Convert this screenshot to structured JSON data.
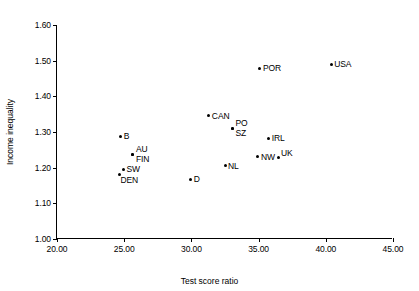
{
  "chart_data": {
    "type": "scatter",
    "title": "",
    "xlabel": "Test score ratio",
    "ylabel": "Income inequality",
    "xlim": [
      20.0,
      45.0
    ],
    "ylim": [
      1.0,
      1.6
    ],
    "xticks": [
      "20.00",
      "25.00",
      "30.00",
      "35.00",
      "40.00",
      "45.00"
    ],
    "yticks": [
      "1.60",
      "1.50",
      "1.40",
      "1.30",
      "1.20",
      "1.10",
      "1.00"
    ],
    "xtick_values": [
      20,
      25,
      30,
      35,
      40,
      45
    ],
    "ytick_values": [
      1.6,
      1.5,
      1.4,
      1.3,
      1.2,
      1.1,
      1.0
    ],
    "grid": false,
    "legend": "none",
    "marker_color": "#000000",
    "axis_color": "#000000",
    "background": "#ffffff",
    "points": [
      {
        "label": "B",
        "x": 24.75,
        "y": 1.288,
        "label_pos": "lab-r"
      },
      {
        "label": "AU",
        "x": 25.65,
        "y": 1.237,
        "label_pos": "lab-rt"
      },
      {
        "label": "FIN",
        "x": 25.65,
        "y": 1.237,
        "label_pos": "lab-rb"
      },
      {
        "label": "SW",
        "x": 24.95,
        "y": 1.195,
        "label_pos": "lab-r"
      },
      {
        "label": "DEN",
        "x": 24.65,
        "y": 1.181,
        "label_pos": "lab-b"
      },
      {
        "label": "D",
        "x": 29.95,
        "y": 1.168,
        "label_pos": "lab-r"
      },
      {
        "label": "CAN",
        "x": 31.3,
        "y": 1.345,
        "label_pos": "lab-r"
      },
      {
        "label": "PO",
        "x": 33.05,
        "y": 1.311,
        "label_pos": "lab-rt"
      },
      {
        "label": "SZ",
        "x": 33.05,
        "y": 1.311,
        "label_pos": "lab-rb"
      },
      {
        "label": "NL",
        "x": 32.5,
        "y": 1.205,
        "label_pos": "lab-r"
      },
      {
        "label": "NW",
        "x": 34.95,
        "y": 1.23,
        "label_pos": "lab-r"
      },
      {
        "label": "UK",
        "x": 36.45,
        "y": 1.228,
        "label_pos": "lab-rt"
      },
      {
        "label": "IRL",
        "x": 35.75,
        "y": 1.283,
        "label_pos": "lab-r"
      },
      {
        "label": "POR",
        "x": 35.1,
        "y": 1.479,
        "label_pos": "lab-r"
      },
      {
        "label": "USA",
        "x": 40.4,
        "y": 1.49,
        "label_pos": "lab-r"
      }
    ]
  }
}
